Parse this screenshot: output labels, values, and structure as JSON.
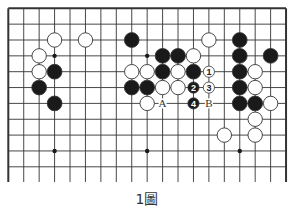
{
  "diagram": {
    "caption": "1圖",
    "board": {
      "columns": 19,
      "visible_rows": 12,
      "origin_x": 8.3,
      "origin_y": 8.3,
      "spacing_x": 15.43,
      "spacing_y": 15.85,
      "line_bottom_y": 182,
      "line_color": "#333333",
      "edge_color": "#333333",
      "edges": [
        "top",
        "left",
        "right"
      ]
    },
    "star_points": [
      [
        3,
        3
      ],
      [
        9,
        3
      ],
      [
        15,
        3
      ],
      [
        3,
        9
      ],
      [
        9,
        9
      ],
      [
        15,
        9
      ]
    ],
    "stones": {
      "black": [
        [
          3,
          4
        ],
        [
          2,
          5
        ],
        [
          3,
          6
        ],
        [
          8,
          2
        ],
        [
          10,
          3
        ],
        [
          11,
          3
        ],
        [
          10,
          4
        ],
        [
          12,
          4
        ],
        [
          8,
          5
        ],
        [
          9,
          5
        ],
        [
          15,
          2
        ],
        [
          15,
          3
        ],
        [
          17,
          3
        ],
        [
          15,
          4
        ],
        [
          15,
          5
        ],
        [
          15,
          6
        ],
        [
          16,
          6
        ]
      ],
      "white": [
        [
          3,
          2
        ],
        [
          5,
          2
        ],
        [
          2,
          3
        ],
        [
          2,
          4
        ],
        [
          13,
          2
        ],
        [
          12,
          3
        ],
        [
          8,
          4
        ],
        [
          9,
          4
        ],
        [
          11,
          4
        ],
        [
          10,
          5
        ],
        [
          11,
          5
        ],
        [
          9,
          6
        ],
        [
          16,
          4
        ],
        [
          16,
          5
        ],
        [
          17,
          6
        ],
        [
          16,
          7
        ],
        [
          14,
          8
        ],
        [
          16,
          8
        ]
      ]
    },
    "numbered_moves": [
      {
        "number": "1",
        "color": "white",
        "col": 13,
        "row": 4
      },
      {
        "number": "2",
        "color": "black",
        "col": 12,
        "row": 5
      },
      {
        "number": "3",
        "color": "white",
        "col": 13,
        "row": 5
      },
      {
        "number": "4",
        "color": "black",
        "col": 12,
        "row": 6
      }
    ],
    "labels": [
      {
        "text": "A",
        "col": 10,
        "row": 6
      },
      {
        "text": "B",
        "col": 13,
        "row": 6
      }
    ],
    "colors": {
      "black_stone": "#1a1a1a",
      "white_stone": "#ffffff",
      "stone_outline": "#333333"
    }
  }
}
